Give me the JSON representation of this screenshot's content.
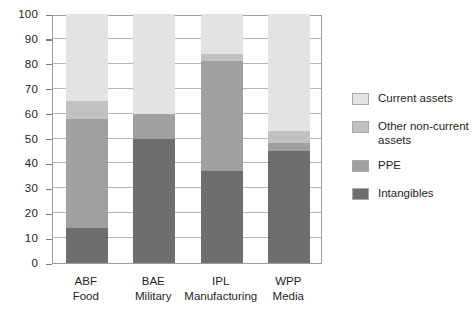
{
  "chart_data": {
    "type": "bar",
    "stacked": true,
    "title": "",
    "subtitle": "",
    "xlabel": "",
    "ylabel": "",
    "ylim": [
      0,
      100
    ],
    "yticks": [
      0,
      10,
      20,
      30,
      40,
      50,
      60,
      70,
      80,
      90,
      100
    ],
    "grid": true,
    "legend_position": "right",
    "categories": [
      "ABF",
      "BAE",
      "IPL",
      "WPP"
    ],
    "category_sublabels": [
      "Food",
      "Military",
      "Manufacturing",
      "Media"
    ],
    "series": [
      {
        "name": "Intangibles",
        "values": [
          14,
          50,
          37,
          45
        ],
        "color": "#6e6e6e"
      },
      {
        "name": "PPE",
        "values": [
          44,
          10,
          44,
          3
        ],
        "color": "#a0a0a0"
      },
      {
        "name": "Other non-current assets",
        "values": [
          7,
          0,
          3,
          5
        ],
        "color": "#c2c2c2"
      },
      {
        "name": "Current assets",
        "values": [
          35,
          40,
          16,
          47
        ],
        "color": "#e3e3e3"
      }
    ],
    "cumulative_tops": {
      "ABF": {
        "intangibles": 14,
        "ppe": 58,
        "other": 65,
        "current": 100
      },
      "BAE": {
        "intangibles": 50,
        "ppe": 60,
        "other": 60,
        "current": 100
      },
      "IPL": {
        "intangibles": 37,
        "ppe": 81,
        "other": 84,
        "current": 100
      },
      "WPP": {
        "intangibles": 45,
        "ppe": 48,
        "other": 53,
        "current": 100
      }
    }
  },
  "axis": {
    "yticks": [
      "100",
      "90",
      "80",
      "70",
      "60",
      "50",
      "40",
      "30",
      "20",
      "10",
      "0"
    ]
  },
  "categories": [
    {
      "code": "ABF",
      "sector": "Food"
    },
    {
      "code": "BAE",
      "sector": "Military"
    },
    {
      "code": "IPL",
      "sector": "Manufacturing"
    },
    {
      "code": "WPP",
      "sector": "Media"
    }
  ],
  "legend": {
    "items": [
      {
        "label": "Current assets",
        "color": "#e3e3e3"
      },
      {
        "label": "Other non-current assets",
        "color": "#c2c2c2"
      },
      {
        "label": "PPE",
        "color": "#a0a0a0"
      },
      {
        "label": "Intangibles",
        "color": "#6e6e6e"
      }
    ]
  },
  "colors": {
    "current_assets": "#e3e3e3",
    "other_non_current_assets": "#c2c2c2",
    "ppe": "#a0a0a0",
    "intangibles": "#6e6e6e",
    "axis": "#9d9d9d",
    "grid": "#b6b6b6",
    "text": "#231f20"
  }
}
